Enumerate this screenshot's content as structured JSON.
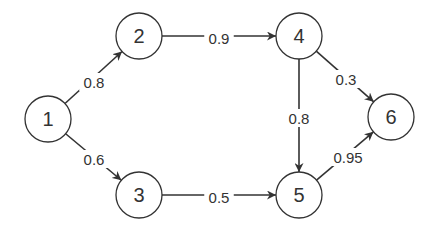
{
  "diagram": {
    "type": "directed-weighted-graph",
    "colors": {
      "stroke": "#333333",
      "fill": "#ffffff",
      "text": "#333333"
    },
    "nodes": [
      {
        "id": "1",
        "label": "1",
        "x": 48,
        "y": 119
      },
      {
        "id": "2",
        "label": "2",
        "x": 139,
        "y": 36
      },
      {
        "id": "3",
        "label": "3",
        "x": 139,
        "y": 195
      },
      {
        "id": "4",
        "label": "4",
        "x": 299,
        "y": 36
      },
      {
        "id": "5",
        "label": "5",
        "x": 299,
        "y": 195
      },
      {
        "id": "6",
        "label": "6",
        "x": 391,
        "y": 117
      }
    ],
    "edges": [
      {
        "from": "1",
        "to": "2",
        "weight": "0.8",
        "label_x": 94,
        "label_y": 82
      },
      {
        "from": "1",
        "to": "3",
        "weight": "0.6",
        "label_x": 94,
        "label_y": 159
      },
      {
        "from": "2",
        "to": "4",
        "weight": "0.9",
        "label_x": 219,
        "label_y": 38
      },
      {
        "from": "3",
        "to": "5",
        "weight": "0.5",
        "label_x": 219,
        "label_y": 197
      },
      {
        "from": "4",
        "to": "5",
        "weight": "0.8",
        "label_x": 299,
        "label_y": 118
      },
      {
        "from": "4",
        "to": "6",
        "weight": "0.3",
        "label_x": 346,
        "label_y": 79
      },
      {
        "from": "5",
        "to": "6",
        "weight": "0.95",
        "label_x": 348,
        "label_y": 157
      }
    ]
  }
}
